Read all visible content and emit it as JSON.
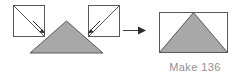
{
  "figure": {
    "type": "quilting-block-assembly-diagram",
    "caption": "Make 136",
    "colors": {
      "fabric_fill": "#a8a8a8",
      "outline": "#595959",
      "background": "#ffffff",
      "arrow": "#333333",
      "caption_text": "#8f8f8f"
    },
    "left_group": {
      "name": "units-before-assembly",
      "center_piece": {
        "label": "center-gray-triangle",
        "shape": "triangle",
        "fill": "#a8a8a8"
      },
      "side_pieces": [
        {
          "label": "left-corner-square",
          "shape": "square-with-diagonal",
          "fill": "#ffffff",
          "diagonal": "top-left-to-bottom-right"
        },
        {
          "label": "right-corner-square",
          "shape": "square-with-diagonal",
          "fill": "#ffffff",
          "diagonal": "top-right-to-bottom-left"
        }
      ],
      "placement_arrows": [
        {
          "label": "left-placement-arrow",
          "direction": "down-right"
        },
        {
          "label": "right-placement-arrow",
          "direction": "down-left"
        }
      ]
    },
    "transform_arrow": {
      "label": "becomes-arrow",
      "direction": "right"
    },
    "right_group": {
      "name": "finished-unit",
      "shape": "rectangle-with-centered-triangle",
      "rectangle_fill": "#ffffff",
      "triangle_fill": "#a8a8a8"
    }
  }
}
